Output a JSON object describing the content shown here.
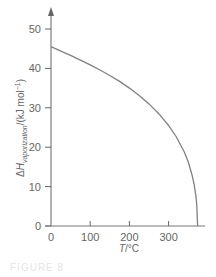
{
  "chart_data": {
    "type": "line",
    "title": "",
    "xlabel": "T/°C",
    "ylabel": "ΔH_vaporization/(kJ mol⁻¹)",
    "ylabel_parts": {
      "delta": "Δ",
      "symbol": "H",
      "subscript": "vaporization",
      "unit": "/(kJ mol",
      "unit_exp": "−1",
      "unit_close": ")"
    },
    "xlim": [
      0,
      390
    ],
    "ylim": [
      0,
      55
    ],
    "x_ticks": [
      0,
      100,
      200,
      300
    ],
    "y_ticks": [
      0,
      10,
      20,
      30,
      40,
      50
    ],
    "grid": false,
    "legend": null,
    "series": [
      {
        "name": "Enthalpy of vaporization of water",
        "color": "#808080",
        "x": [
          0,
          25,
          50,
          75,
          100,
          125,
          150,
          175,
          200,
          225,
          250,
          275,
          300,
          320,
          340,
          350,
          360,
          365,
          370,
          372,
          374
        ],
        "y": [
          45.5,
          44.4,
          43.3,
          42.1,
          40.9,
          39.6,
          38.2,
          36.7,
          35.0,
          33.1,
          31.0,
          28.5,
          25.5,
          22.6,
          18.8,
          16.3,
          12.9,
          10.6,
          7.4,
          5.2,
          0
        ]
      }
    ]
  },
  "caption": "FIGURE 8"
}
